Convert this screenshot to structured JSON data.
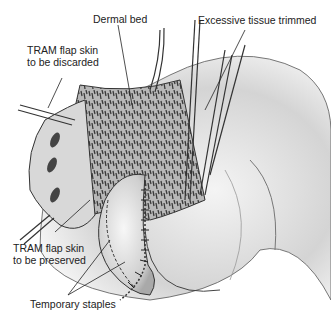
{
  "figure": {
    "colors": {
      "ink": "#222222",
      "skin_light": "#e6e6e6",
      "skin_mid": "#bdbdbd",
      "dermis": "#8a8a8a",
      "background": "#ffffff"
    }
  },
  "labels": {
    "dermal_bed": "Dermal bed",
    "excessive_tissue": "Excessive tissue trimmed",
    "flap_discarded": "TRAM flap skin\nto be discarded",
    "flap_preserved": "TRAM flap skin\nto be preserved",
    "temporary_staples": "Temporary staples"
  }
}
